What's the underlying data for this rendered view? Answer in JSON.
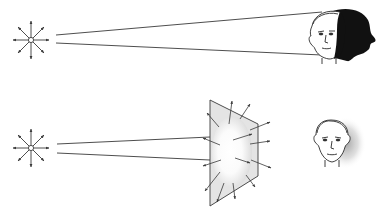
{
  "diagram": {
    "colors": {
      "background": "#ffffff",
      "line": "#3a3a3a",
      "shadow": "#111111",
      "panel_fill": "#e6e6e6",
      "panel_glow": "#ffffff",
      "soft_shadow": "#9a9a9a"
    },
    "panels": [
      {
        "id": "hard-light",
        "light_source": {
          "type": "point-light-icon",
          "rays": 8
        },
        "beam": "narrow-beam-direct",
        "subject": "face-with-hard-shadow"
      },
      {
        "id": "soft-light",
        "light_source": {
          "type": "point-light-icon",
          "rays": 8
        },
        "beam": "narrow-beam-to-diffuser",
        "modifier": "diffuser-panel",
        "modifier_scatter_arrows": 14,
        "subject": "face-with-soft-shadow"
      }
    ]
  }
}
